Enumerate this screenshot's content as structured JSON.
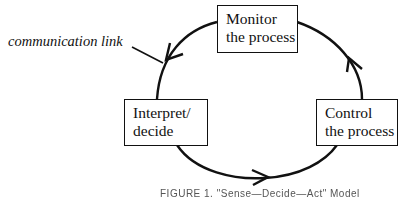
{
  "diagram": {
    "type": "cycle",
    "nodes": [
      {
        "id": "monitor",
        "lines": [
          "Monitor",
          "the process"
        ]
      },
      {
        "id": "control",
        "lines": [
          "Control",
          "the process"
        ]
      },
      {
        "id": "interpret",
        "lines": [
          "Interpret/",
          "decide"
        ]
      }
    ],
    "edges": [
      {
        "from": "monitor",
        "to": "interpret",
        "direction": "counter-clockwise"
      },
      {
        "from": "interpret",
        "to": "control",
        "direction": "counter-clockwise"
      },
      {
        "from": "control",
        "to": "monitor",
        "direction": "counter-clockwise"
      }
    ],
    "annotation": {
      "text": "communication link",
      "points_to": "edge monitor→interpret"
    },
    "caption": "FIGURE 1. \"Sense—Decide—Act\" Model"
  },
  "colors": {
    "stroke": "#111111",
    "background": "#ffffff"
  }
}
